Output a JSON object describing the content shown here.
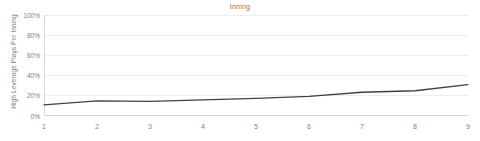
{
  "chart_data": {
    "type": "line",
    "title": "Inning",
    "xlabel": "",
    "ylabel": "High Leverage Plays Per Inning",
    "categories": [
      "1",
      "2",
      "3",
      "4",
      "5",
      "6",
      "7",
      "8",
      "9"
    ],
    "x": [
      1,
      2,
      3,
      4,
      5,
      6,
      7,
      8,
      9
    ],
    "values": [
      0.11,
      0.15,
      0.145,
      0.16,
      0.175,
      0.195,
      0.235,
      0.25,
      0.31
    ],
    "value_labels": [
      "11%",
      "15%",
      "15%",
      "16%",
      "18%",
      "20%",
      "24%",
      "25%",
      "31%"
    ],
    "ylim": [
      0,
      1
    ],
    "xlim": [
      1,
      9
    ],
    "yticks": [
      0,
      0.2,
      0.4,
      0.6,
      0.8,
      1.0
    ],
    "ytick_labels": [
      "0%",
      "20%",
      "40%",
      "60%",
      "80%",
      "100%"
    ],
    "grid": true,
    "grid_axis": "y",
    "legend": false,
    "legend_position": "none",
    "series": [
      {
        "name": "High Leverage Plays Per Inning",
        "values": [
          0.11,
          0.15,
          0.145,
          0.16,
          0.175,
          0.195,
          0.235,
          0.25,
          0.31
        ],
        "color": "#404040"
      }
    ],
    "colors": {
      "line": "#404040",
      "grid": "#ededed",
      "axis": "#d9d9d9",
      "text": "#808080",
      "background": "#ffffff"
    }
  }
}
